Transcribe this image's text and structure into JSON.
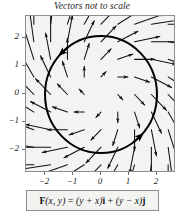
{
  "figure": {
    "title": "Vectors not to scale",
    "equation_plain": "F(x, y) = (y + x)i + (y − x)j",
    "equation_parts": {
      "field_symbol": "F",
      "args": "(x, y)",
      "equals": "=",
      "term_i": "(y + x)",
      "unit_i": "i",
      "plus": "+",
      "term_j": "(y − x)",
      "unit_j": "j"
    },
    "colors": {
      "page_background": "#ffffff",
      "plot_background": "#f3f3f2",
      "frame_border": "#8d8d8d",
      "arrow": "#111111",
      "circle": "#000000",
      "text": "#1c1c1c"
    }
  },
  "chart_data": {
    "type": "scatter",
    "subtype": "vector-field-quiver",
    "title": "Vectors not to scale",
    "xlabel": "",
    "ylabel": "",
    "xlim": [
      -2.68,
      2.68
    ],
    "ylim": [
      -2.68,
      2.68
    ],
    "grid": false,
    "legend": null,
    "annotations": [
      "Vectors not to scale",
      "F(x, y) = (y + x)i + (y − x)j"
    ],
    "xticks": [
      -2,
      -1,
      0,
      1,
      2
    ],
    "xtick_labels": [
      "−2",
      "−1",
      "0",
      "1",
      "2"
    ],
    "yticks": [
      -2,
      -1,
      0,
      1,
      2
    ],
    "ytick_labels": [
      "−2",
      "−1",
      "0",
      "1",
      "2"
    ],
    "field": {
      "function_i": "y + x",
      "function_j": "y - x",
      "grid_x": [
        -2.4,
        -1.8,
        -1.2,
        -0.6,
        0.0,
        0.6,
        1.2,
        1.8,
        2.4
      ],
      "grid_y": [
        -2.4,
        -1.8,
        -1.2,
        -0.6,
        0.0,
        0.6,
        1.2,
        1.8,
        2.4
      ],
      "arrow_scale": 0.3,
      "note": "arrow length proportional to sqrt(2)*r, rotated 45 degrees from radial; vectors not to scale"
    },
    "overlay_curve": {
      "shape": "circle",
      "center": [
        0,
        0
      ],
      "radius": 2,
      "orientation": "counterclockwise",
      "line_width": 2,
      "arrowheads_at_angles_deg": [
        135,
        -45
      ]
    }
  },
  "ticks": {
    "x": [
      {
        "value": "−2",
        "px": 44
      },
      {
        "value": "−1",
        "px": 72
      },
      {
        "value": "0",
        "px": 100
      },
      {
        "value": "1",
        "px": 128
      },
      {
        "value": "2",
        "px": 156
      }
    ],
    "y": [
      {
        "value": "2",
        "px": 37
      },
      {
        "value": "1",
        "px": 65
      },
      {
        "value": "0",
        "px": 93
      },
      {
        "value": "−1",
        "px": 121
      },
      {
        "value": "−2",
        "px": 149
      }
    ]
  }
}
